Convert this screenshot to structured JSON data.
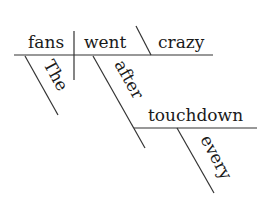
{
  "diagram": {
    "type": "Reed-Kellogg sentence diagram",
    "sentence_words": {
      "subject": "fans",
      "verb": "went",
      "predicate_adjective": "crazy",
      "subject_modifier": "The",
      "preposition": "after",
      "prepositional_object": "touchdown",
      "object_modifier": "every"
    },
    "colors": {
      "line": "#333333",
      "text": "#1a1a1a",
      "background": "#ffffff"
    }
  }
}
